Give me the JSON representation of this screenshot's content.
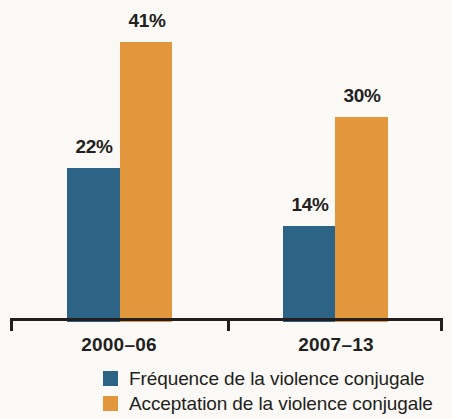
{
  "chart_data": {
    "type": "bar",
    "title": "",
    "subtitle": "",
    "xlabel": "",
    "ylabel": "",
    "grid": false,
    "legend_position": "bottom",
    "ylim": [
      0,
      41
    ],
    "axis_visible": "x-only",
    "categories": [
      "2000–06",
      "2007–13"
    ],
    "series": [
      {
        "name": "Fréquence de la violence conjugale",
        "color": "#2d6384",
        "values": [
          22,
          14
        ],
        "value_labels": [
          "22%",
          "30%"
        ]
      },
      {
        "name": "Acceptation de la violence conjugale",
        "color": "#e2973c",
        "values": [
          41,
          30
        ],
        "value_labels": [
          "41%",
          "30%"
        ]
      }
    ],
    "bars": [
      {
        "group": "2000–06",
        "series": "Fréquence de la violence conjugale",
        "value": 22,
        "label": "22%"
      },
      {
        "group": "2000–06",
        "series": "Acceptation de la violence conjugale",
        "value": 41,
        "label": "41%"
      },
      {
        "group": "2007–13",
        "series": "Fréquence de la violence conjugale",
        "value": 14,
        "label": "14%"
      },
      {
        "group": "2007–13",
        "series": "Acceptation de la violence conjugale",
        "value": 30,
        "label": "30%"
      }
    ]
  },
  "labels": {
    "g1_freq": "22%",
    "g1_accept": "41%",
    "g2_freq": "14%",
    "g2_accept": "30%",
    "cat1": "2000–06",
    "cat2": "2007–13"
  },
  "legend": {
    "items": [
      {
        "label": "Fréquence de la violence conjugale",
        "color": "#2d6384"
      },
      {
        "label": "Acceptation de la violence conjugale",
        "color": "#e2973c"
      }
    ]
  },
  "colors": {
    "series_freq": "#2d6384",
    "series_accept": "#e2973c",
    "axis": "#231f20",
    "text": "#231f20",
    "background": "#fbf9f5"
  }
}
